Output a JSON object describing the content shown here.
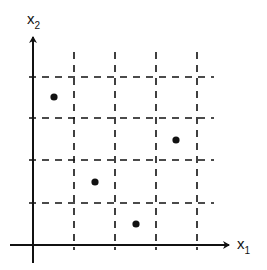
{
  "diagram": {
    "type": "scatter-grid",
    "x_axis": {
      "label": "x",
      "subscript": "1"
    },
    "y_axis": {
      "label": "x",
      "subscript": "2"
    },
    "grid": {
      "style": "dashed",
      "vertical_lines_px": [
        74,
        115,
        156,
        197
      ],
      "horizontal_lines_px": [
        77,
        118,
        160,
        203
      ],
      "cell_size_px": 41
    },
    "origin_px": [
      33,
      245
    ],
    "points_px": [
      {
        "x": 54,
        "y": 97
      },
      {
        "x": 95,
        "y": 182
      },
      {
        "x": 136,
        "y": 224
      },
      {
        "x": 176,
        "y": 140
      }
    ],
    "points_grid": [
      {
        "col": 0.5,
        "row": 3.5
      },
      {
        "col": 1.5,
        "row": 1.5
      },
      {
        "col": 2.5,
        "row": 0.5
      },
      {
        "col": 3.5,
        "row": 2.5
      }
    ],
    "colors": {
      "ink": "#111111",
      "background": "#ffffff"
    }
  }
}
